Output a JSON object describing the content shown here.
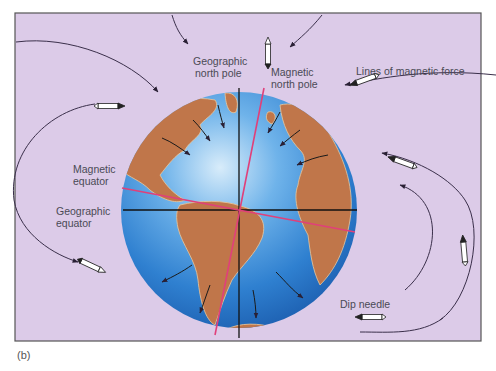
{
  "figure": {
    "caption": "(b)",
    "colors": {
      "background": "#dccbe8",
      "frame": "#555555",
      "ocean": "#2e7fd0",
      "land": "#c0764a",
      "magnetic_axis": "#e0407a",
      "geographic_axis": "#111111",
      "field_line": "#3a2f4a"
    }
  },
  "labels": {
    "geographic_north_pole": [
      "Geographic",
      "north pole"
    ],
    "magnetic_north_pole": [
      "Magnetic",
      "north pole"
    ],
    "lines_of_magnetic_force": "Lines of magnetic force",
    "magnetic_equator": [
      "Magnetic",
      "equator"
    ],
    "geographic_equator": [
      "Geographic",
      "equator"
    ],
    "dip_needle": "Dip needle"
  }
}
